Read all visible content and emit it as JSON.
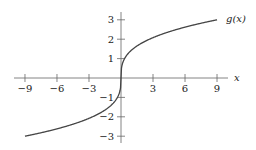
{
  "chart_data": {
    "type": "line",
    "title": "",
    "xlabel": "x",
    "ylabel": "",
    "xlim": [
      -10.5,
      10.5
    ],
    "ylim": [
      -3.5,
      3.5
    ],
    "x_ticks": [
      -9,
      -6,
      -3,
      3,
      6,
      9
    ],
    "x_tick_labels": [
      "−9",
      "−6",
      "−3",
      "3",
      "6",
      "9"
    ],
    "y_ticks": [
      3,
      2,
      1,
      -1,
      -2,
      -3
    ],
    "y_tick_labels": [
      "3",
      "2",
      "1",
      "−1",
      "−2",
      "−3"
    ],
    "grid": false,
    "legend": null,
    "series": [
      {
        "name": "g(x)",
        "label": "g(x)",
        "function": "cbrt(3x)",
        "x": [
          -9,
          -6,
          -3,
          -1,
          -0.3,
          0,
          0.3,
          1,
          3,
          6,
          9
        ],
        "y": [
          -3.0,
          -2.62,
          -2.08,
          -1.44,
          -0.97,
          0,
          0.97,
          1.44,
          2.08,
          2.62,
          3.0
        ]
      }
    ],
    "annotations": [
      {
        "text": "g(x)",
        "x": 9,
        "y": 3
      }
    ]
  },
  "labels": {
    "x_axis": "x",
    "curve": "g(x)"
  }
}
